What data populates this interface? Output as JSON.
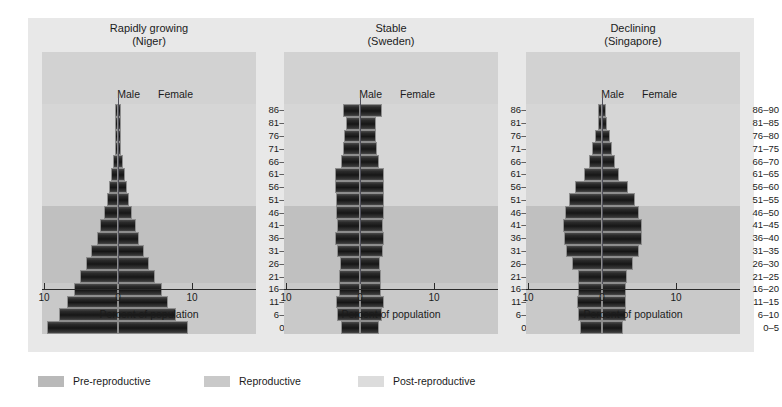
{
  "figure": {
    "axis_label": "Percent of population",
    "male_label": "Male",
    "female_label": "Female",
    "tick_labels": [
      "10",
      "0",
      "10"
    ],
    "xlim": [
      -10,
      10
    ],
    "age_groups": [
      "0–5",
      "6–10",
      "11–15",
      "16–20",
      "21–25",
      "26–30",
      "31–35",
      "36–40",
      "41–45",
      "46–50",
      "51–55",
      "56–60",
      "61–65",
      "66–70",
      "71–75",
      "76–80",
      "81–85",
      "86–90"
    ],
    "bands": {
      "pre_label": "Pre-reproductive",
      "repro_label": "Reproductive",
      "post_label": "Post-reproductive",
      "pre_range": [
        0,
        3
      ],
      "repro_range": [
        4,
        9
      ],
      "post_range": [
        10,
        17
      ]
    },
    "colors": {
      "page_background": "#ffffff",
      "figure_background": "#e8e8e8",
      "plot_background": "#d2d2d2",
      "band_pre": "#c9c9c9",
      "band_reproductive": "#c0c0c0",
      "band_post": "#d6d6d6",
      "bar_dark": "#1b1b1b",
      "bar_edge": "#8d8d8d",
      "center_line": "#50505a",
      "axis_line": "#2b2b2b",
      "text": "#1b1b1b"
    }
  },
  "legend": {
    "items": [
      {
        "label": "Pre-reproductive",
        "swatch": "#b9b9b9"
      },
      {
        "label": "Reproductive",
        "swatch": "#c9c9c9"
      },
      {
        "label": "Post-reproductive",
        "swatch": "#dcdcdc"
      }
    ]
  },
  "chart_data": [
    {
      "type": "bar",
      "title": "Rapidly growing\n(Niger)",
      "country": "Niger",
      "pattern": "Rapidly growing",
      "xlabel": "Percent of population",
      "ylabel": "",
      "xlim": [
        -10,
        10
      ],
      "grid": false,
      "legend_position": "bottom",
      "categories": [
        "0–5",
        "6–10",
        "11–15",
        "16–20",
        "21–25",
        "26–30",
        "31–35",
        "36–40",
        "41–45",
        "46–50",
        "51–55",
        "56–60",
        "61–65",
        "66–70",
        "71–75",
        "76–80",
        "81–85",
        "86–90"
      ],
      "series": [
        {
          "name": "Male",
          "values": [
            9.6,
            8.0,
            6.9,
            6.0,
            5.1,
            4.3,
            3.6,
            2.9,
            2.4,
            1.9,
            1.5,
            1.2,
            0.9,
            0.65,
            0.45,
            0.3,
            0.16,
            0.08
          ]
        },
        {
          "name": "Female",
          "values": [
            9.5,
            7.9,
            6.8,
            5.9,
            5.0,
            4.2,
            3.5,
            2.9,
            2.4,
            1.9,
            1.5,
            1.2,
            0.9,
            0.65,
            0.45,
            0.3,
            0.16,
            0.08
          ]
        }
      ]
    },
    {
      "type": "bar",
      "title": "Stable\n(Sweden)",
      "country": "Sweden",
      "pattern": "Stable",
      "xlabel": "Percent of population",
      "ylabel": "",
      "xlim": [
        -10,
        10
      ],
      "grid": false,
      "legend_position": "bottom",
      "categories": [
        "0–5",
        "6–10",
        "11–15",
        "16–20",
        "21–25",
        "26–30",
        "31–35",
        "36–40",
        "41–45",
        "46–50",
        "51–55",
        "56–60",
        "61–65",
        "66–70",
        "71–75",
        "76–80",
        "81–85",
        "86–90"
      ],
      "series": [
        {
          "name": "Male",
          "values": [
            2.6,
            3.1,
            3.3,
            2.9,
            2.8,
            2.7,
            3.1,
            3.4,
            3.1,
            3.3,
            3.3,
            3.4,
            3.4,
            2.6,
            2.3,
            2.2,
            1.9,
            2.3
          ]
        },
        {
          "name": "Female",
          "values": [
            2.6,
            3.0,
            3.2,
            2.8,
            2.8,
            2.7,
            3.1,
            3.3,
            3.1,
            3.3,
            3.3,
            3.3,
            3.3,
            2.6,
            2.3,
            2.2,
            2.1,
            3.0
          ]
        }
      ]
    },
    {
      "type": "bar",
      "title": "Declining\n(Singapore)",
      "country": "Singapore",
      "pattern": "Declining",
      "xlabel": "Percent of population",
      "ylabel": "",
      "xlim": [
        -10,
        10
      ],
      "grid": false,
      "legend_position": "bottom",
      "categories": [
        "0–5",
        "6–10",
        "11–15",
        "16–20",
        "21–25",
        "26–30",
        "31–35",
        "36–40",
        "41–45",
        "46–50",
        "51–55",
        "56–60",
        "61–65",
        "66–70",
        "71–75",
        "76–80",
        "81–85",
        "86–90"
      ],
      "series": [
        {
          "name": "Male",
          "values": [
            3.0,
            3.3,
            3.4,
            3.3,
            3.3,
            4.1,
            4.9,
            5.2,
            5.3,
            5.0,
            4.5,
            3.6,
            2.4,
            1.7,
            1.3,
            1.0,
            0.6,
            0.55
          ]
        },
        {
          "name": "Female",
          "values": [
            2.9,
            3.2,
            3.3,
            3.3,
            3.4,
            4.2,
            5.0,
            5.4,
            5.4,
            5.0,
            4.4,
            3.5,
            2.3,
            1.7,
            1.4,
            1.1,
            0.7,
            0.6
          ]
        }
      ]
    }
  ]
}
